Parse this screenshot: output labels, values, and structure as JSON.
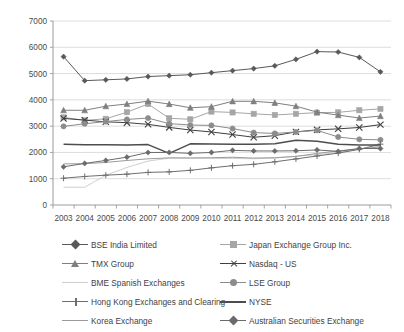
{
  "chart_data": {
    "type": "line",
    "title": "",
    "xlabel": "",
    "ylabel": "",
    "x": [
      2003,
      2004,
      2005,
      2006,
      2007,
      2008,
      2009,
      2010,
      2011,
      2012,
      2013,
      2014,
      2015,
      2016,
      2017,
      2018
    ],
    "xticklabels": [
      "2003",
      "2004",
      "2005",
      "2006",
      "2007",
      "2008",
      "2009",
      "2010",
      "2011",
      "2012",
      "2013",
      "2014",
      "2015",
      "2016",
      "2017",
      "2018"
    ],
    "yticklabels": [
      "0",
      "1000",
      "2000",
      "3000",
      "4000",
      "5000",
      "6000",
      "7000"
    ],
    "yticks": [
      0,
      1000,
      2000,
      3000,
      4000,
      5000,
      6000,
      7000
    ],
    "ylim": [
      0,
      7000
    ],
    "grid": "horizontal",
    "legend_position": "bottom",
    "legend_columns": 2,
    "series": [
      {
        "name": "BSE India Limited",
        "marker": "diamond",
        "color": "#595959",
        "values": [
          5644,
          4730,
          4763,
          4796,
          4887,
          4921,
          4955,
          5034,
          5112,
          5191,
          5294,
          5541,
          5835,
          5820,
          5616,
          5065
        ]
      },
      {
        "name": "Japan Exchange Group Inc.",
        "marker": "square",
        "color": "#a6a6a6",
        "values": [
          3333,
          3220,
          3279,
          3530,
          3844,
          3299,
          3260,
          3553,
          3521,
          3470,
          3424,
          3470,
          3513,
          3524,
          3604,
          3657
        ]
      },
      {
        "name": "TMX Group",
        "marker": "triangle",
        "color": "#7f7f7f",
        "values": [
          3604,
          3604,
          3758,
          3842,
          3951,
          3841,
          3700,
          3741,
          3945,
          3945,
          3886,
          3761,
          3533,
          3419,
          3310,
          3383
        ]
      },
      {
        "name": "Nasdaq - US",
        "marker": "x",
        "color": "#404040",
        "values": [
          3294,
          3229,
          3164,
          3133,
          3069,
          2952,
          2852,
          2778,
          2680,
          2577,
          2637,
          2782,
          2859,
          2897,
          2949,
          3058
        ]
      },
      {
        "name": "BME Spanish Exchanges",
        "marker": "none",
        "color": "#cfcfcf",
        "values": [
          677,
          677,
          1131,
          1430,
          1671,
          1781,
          1789,
          1776,
          1768,
          1761,
          1786,
          1853,
          1918,
          1996,
          2119,
          2250
        ]
      },
      {
        "name": "LSE Group",
        "marker": "circle",
        "color": "#8c8c8c",
        "values": [
          2992,
          3091,
          3173,
          3256,
          3307,
          3096,
          3043,
          3029,
          2908,
          2754,
          2722,
          2777,
          2839,
          2588,
          2498,
          2479
        ]
      },
      {
        "name": "Hong Kong Exchanges and Clearing",
        "marker": "plus",
        "color": "#6e6e6e",
        "values": [
          1020,
          1086,
          1135,
          1173,
          1241,
          1261,
          1319,
          1413,
          1496,
          1547,
          1643,
          1752,
          1866,
          1973,
          2118,
          2315
        ]
      },
      {
        "name": "NYSE",
        "marker": "none",
        "color": "#4d4d4d",
        "values": [
          2308,
          2293,
          2288,
          2280,
          2297,
          1963,
          2327,
          2317,
          2308,
          2308,
          2329,
          2466,
          2424,
          2307,
          2286,
          2285
        ]
      },
      {
        "name": "Korea Exchange",
        "marker": "none",
        "color": "#9b9b9b",
        "values": [
          1563,
          1573,
          1619,
          1694,
          1757,
          1793,
          1788,
          1798,
          1816,
          1784,
          1798,
          1849,
          1961,
          2059,
          2134,
          2207
        ]
      },
      {
        "name": "Australian Securities Exchange",
        "marker": "diamond",
        "color": "#6b6b6b",
        "values": [
          1452,
          1583,
          1694,
          1821,
          1998,
          1999,
          1966,
          2000,
          2079,
          2056,
          2055,
          2063,
          2095,
          2040,
          2151,
          2146
        ]
      }
    ]
  }
}
